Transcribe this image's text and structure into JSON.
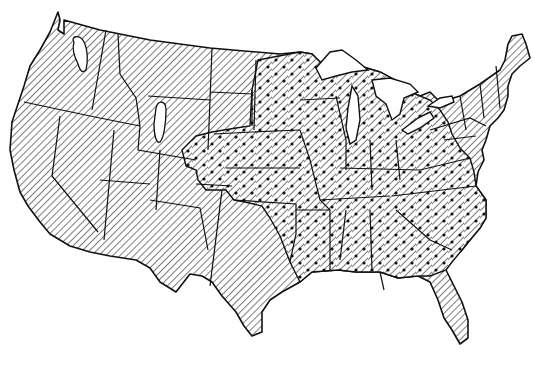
{
  "map": {
    "title": "",
    "type": "choropleth-hatched",
    "region": "Contiguous United States",
    "colors": {
      "ink": "#111111",
      "background": "#ffffff"
    },
    "legend": [],
    "patterns": [
      {
        "id": "hatch",
        "description": "diagonal hatching only",
        "regions": [
          "West",
          "Great Plains (western)",
          "Texas",
          "Florida peninsula",
          "Northeast / New England",
          "Mid-Atlantic"
        ]
      },
      {
        "id": "hatch-dots",
        "description": "diagonal hatching with dots",
        "regions": [
          "Minnesota",
          "Iowa",
          "Wisconsin",
          "Michigan",
          "Illinois",
          "Indiana",
          "Ohio",
          "Missouri",
          "Kansas (eastern)",
          "Oklahoma",
          "Arkansas",
          "Louisiana",
          "Mississippi",
          "Alabama",
          "Georgia",
          "Tennessee",
          "Kentucky",
          "Virginia",
          "North Carolina",
          "South Carolina",
          "eastern Texas",
          "eastern Dakotas",
          "Nebraska (eastern)",
          "West Virginia"
        ]
      },
      {
        "id": "enclave",
        "description": "small unhatched-outlined enclaves",
        "regions": [
          "Washington (Puget area)",
          "Wyoming (western)"
        ]
      }
    ]
  }
}
